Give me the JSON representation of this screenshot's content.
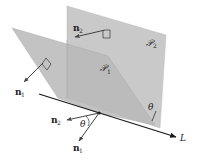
{
  "diagram": {
    "colors": {
      "plane2_fill": "#c9c9c9",
      "plane1_fill": "#b9b9b9",
      "overlap_fill": "#adadad",
      "line": "#1a1a1a",
      "vector": "#444444",
      "text": "#222222",
      "background": "#ffffff"
    },
    "labels": {
      "plane1": "𝒫",
      "plane1_sub": "1",
      "plane2": "𝒫",
      "plane2_sub": "2",
      "normal1_top": "n",
      "normal1_top_sub": "1",
      "normal2_top": "n",
      "normal2_top_sub": "2",
      "normal1_bottom": "n",
      "normal1_bottom_sub": "1",
      "normal2_bottom": "n",
      "normal2_bottom_sub": "2",
      "theta_bottom": "θ",
      "theta_side": "θ",
      "line": "L"
    }
  }
}
